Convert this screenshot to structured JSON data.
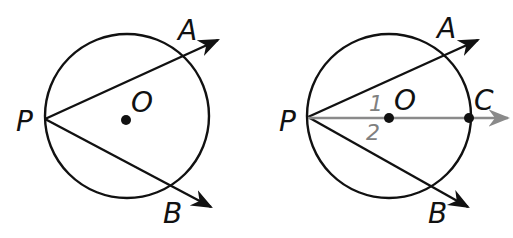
{
  "figures": [
    {
      "id": "left",
      "labels": {
        "P": "P",
        "A": "A",
        "B": "B",
        "O": "O"
      },
      "colors": {
        "stroke": "#111111"
      }
    },
    {
      "id": "right",
      "labels": {
        "P": "P",
        "A": "A",
        "B": "B",
        "O": "O",
        "C": "C",
        "angle1": "1",
        "angle2": "2"
      },
      "colors": {
        "stroke": "#111111",
        "bisector": "#8a8a8a"
      }
    }
  ]
}
